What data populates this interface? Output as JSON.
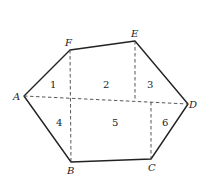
{
  "figure": {
    "type": "hexagon-decomposition",
    "vertices": [
      {
        "id": "A",
        "label": "A",
        "x": 24,
        "y": 96
      },
      {
        "id": "F",
        "label": "F",
        "x": 70,
        "y": 50
      },
      {
        "id": "E",
        "label": "E",
        "x": 135,
        "y": 41
      },
      {
        "id": "D",
        "label": "D",
        "x": 188,
        "y": 104
      },
      {
        "id": "C",
        "label": "C",
        "x": 151,
        "y": 159
      },
      {
        "id": "B",
        "label": "B",
        "x": 71,
        "y": 162
      }
    ],
    "regions": [
      {
        "label": "1",
        "x": 53,
        "y": 88
      },
      {
        "label": "2",
        "x": 106,
        "y": 88
      },
      {
        "label": "3",
        "x": 150,
        "y": 88
      },
      {
        "label": "4",
        "x": 59,
        "y": 126
      },
      {
        "label": "5",
        "x": 115,
        "y": 126
      },
      {
        "label": "6",
        "x": 165,
        "y": 126
      }
    ]
  }
}
